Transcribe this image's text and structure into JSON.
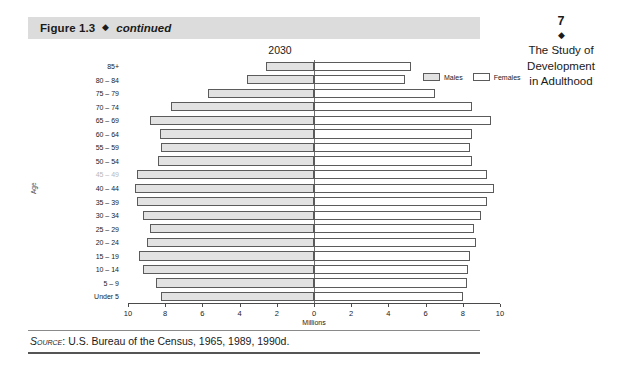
{
  "figure_header": {
    "label": "Figure 1.3",
    "diamond": "◆",
    "continued": "continued"
  },
  "running_head": {
    "page_number": "7",
    "diamond": "◆",
    "line1": "The Study of",
    "line2": "Development",
    "line3": "in Adulthood"
  },
  "source": {
    "prefix": "Source",
    "text": ": U.S. Bureau of the Census, 1965, 1989, 1990d."
  },
  "legend": {
    "males_label": "Males",
    "females_label": "Females",
    "male_color": "#e2e2e2",
    "female_color": "#ffffff",
    "border_color": "#5b5b5b"
  },
  "chart_data": {
    "type": "bar",
    "subtype": "population-pyramid",
    "title": "2030",
    "xlabel": "Millions",
    "ylabel": "Age",
    "xlim": [
      -10,
      10
    ],
    "xticks": [
      10,
      8,
      6,
      4,
      2,
      0,
      2,
      4,
      6,
      8,
      10
    ],
    "grid": false,
    "legend_position": "top-right",
    "categories": [
      "85+",
      "80 – 84",
      "75 – 79",
      "70 – 74",
      "65 – 69",
      "60 – 64",
      "55 – 59",
      "50 – 54",
      "45 – 49",
      "40 – 44",
      "35 – 39",
      "30 – 34",
      "25 – 29",
      "20 – 24",
      "15 – 19",
      "10 – 14",
      "5 – 9",
      "Under 5"
    ],
    "series": [
      {
        "name": "Males",
        "values": [
          2.6,
          3.6,
          5.7,
          7.7,
          8.8,
          8.3,
          8.2,
          8.4,
          9.5,
          9.6,
          9.5,
          9.2,
          8.8,
          9.0,
          9.4,
          9.2,
          8.5,
          8.2
        ]
      },
      {
        "name": "Females",
        "values": [
          5.2,
          4.9,
          6.5,
          8.5,
          9.5,
          8.5,
          8.4,
          8.5,
          9.3,
          9.7,
          9.3,
          9.0,
          8.6,
          8.7,
          8.4,
          8.3,
          8.2,
          8.0
        ]
      }
    ]
  }
}
